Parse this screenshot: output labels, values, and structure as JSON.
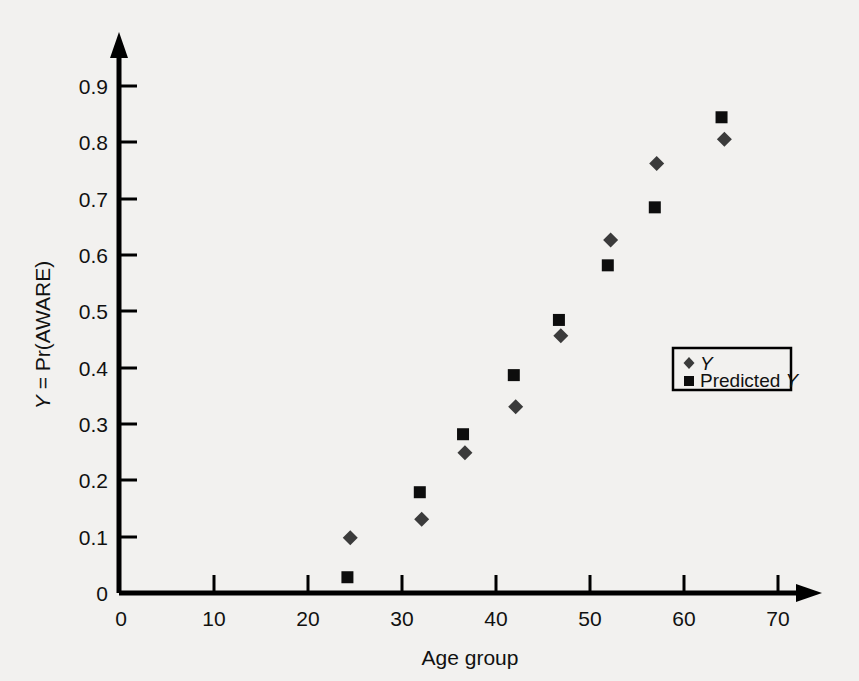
{
  "chart_data": {
    "type": "scatter",
    "title": "",
    "xlabel": "Age group",
    "ylabel": "Y = Pr(AWARE)",
    "ylabel_parts": {
      "italic": "Y",
      "rest": " = Pr(AWARE)"
    },
    "xlim": [
      0,
      74
    ],
    "ylim": [
      0,
      0.95
    ],
    "xticks": [
      0,
      10,
      20,
      30,
      40,
      50,
      60,
      70
    ],
    "xtick_labels": [
      "0",
      "10",
      "20",
      "30",
      "40",
      "50",
      "60",
      "70"
    ],
    "yticks": [
      0,
      0.1,
      0.2,
      0.3,
      0.4,
      0.5,
      0.6,
      0.7,
      0.8,
      0.9
    ],
    "ytick_labels": [
      "0",
      "0.1",
      "0.2",
      "0.3",
      "0.4",
      "0.5",
      "0.6",
      "0.7",
      "0.8",
      "0.9"
    ],
    "grid": false,
    "legend_position": "center-right",
    "series": [
      {
        "name": "Y",
        "label_italic": "Y",
        "marker": "diamond",
        "color": "#3b3b3b",
        "x": [
          24.6,
          32.2,
          36.8,
          42.2,
          47.0,
          52.3,
          57.2,
          64.4
        ],
        "y": [
          0.098,
          0.131,
          0.249,
          0.331,
          0.457,
          0.627,
          0.763,
          0.806
        ]
      },
      {
        "name": "Predicted Y",
        "label_prefix": "Predicted ",
        "label_italic": "Y",
        "marker": "square",
        "color": "#0d0d0d",
        "x": [
          24.3,
          32.0,
          36.6,
          42.0,
          46.8,
          52.0,
          57.0,
          64.1
        ],
        "y": [
          0.028,
          0.179,
          0.282,
          0.387,
          0.485,
          0.582,
          0.685,
          0.845
        ]
      }
    ]
  },
  "legend": {
    "entries": [
      {
        "marker": "diamond",
        "prefix": "",
        "italic": "Y"
      },
      {
        "marker": "square",
        "prefix": "Predicted ",
        "italic": "Y"
      }
    ]
  },
  "colors": {
    "background": "#f2f1ef",
    "axis": "#000000",
    "observed_marker": "#3b3b3b",
    "predicted_marker": "#0d0d0d",
    "text": "#111111"
  }
}
